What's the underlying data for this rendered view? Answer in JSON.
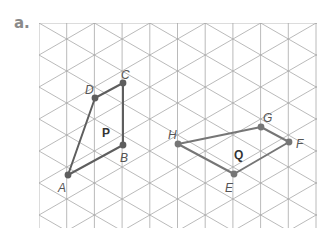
{
  "part_label": "a.",
  "grid": {
    "type": "isometric",
    "x_left": 39,
    "x_right": 317,
    "y_top": 23,
    "y_bottom": 228,
    "column_spacing": 27.7,
    "side_length": 32,
    "origin_y": 23,
    "line_color": "#a8a8a8"
  },
  "shapes": [
    {
      "name": "P",
      "label_pos": [
        102,
        137
      ],
      "color": "#5e5e5e",
      "vertices": [
        {
          "label": "A",
          "x": 68,
          "y": 175,
          "lx": 58,
          "ly": 192
        },
        {
          "label": "B",
          "x": 123,
          "y": 145,
          "lx": 120,
          "ly": 162
        },
        {
          "label": "C",
          "x": 123,
          "y": 83,
          "lx": 121,
          "ly": 79
        },
        {
          "label": "D",
          "x": 95,
          "y": 98,
          "lx": 85,
          "ly": 94
        }
      ]
    },
    {
      "name": "Q",
      "label_pos": [
        234,
        159
      ],
      "color": "#767676",
      "vertices": [
        {
          "label": "E",
          "x": 234,
          "y": 174,
          "lx": 225,
          "ly": 192
        },
        {
          "label": "F",
          "x": 289,
          "y": 142,
          "lx": 296,
          "ly": 148
        },
        {
          "label": "G",
          "x": 261,
          "y": 127,
          "lx": 263,
          "ly": 122
        },
        {
          "label": "H",
          "x": 178,
          "y": 144,
          "lx": 168,
          "ly": 139
        }
      ]
    }
  ]
}
